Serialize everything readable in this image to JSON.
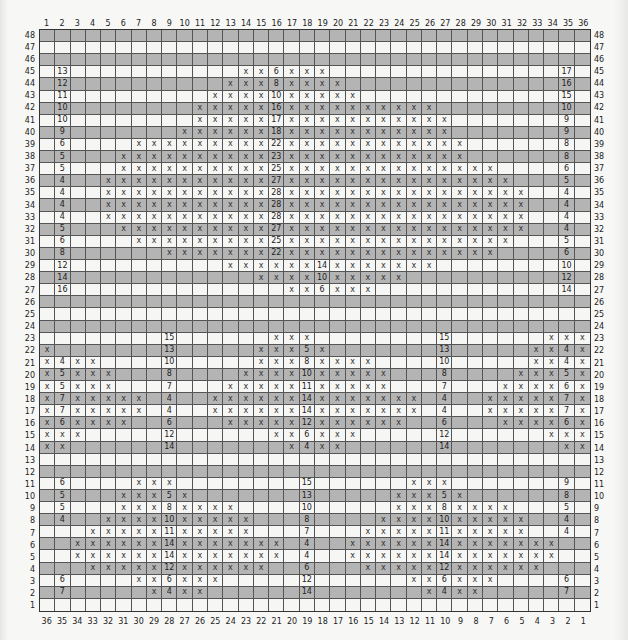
{
  "chart": {
    "columns": 36,
    "rows": 48,
    "top_column_labels": [
      "1",
      "2",
      "3",
      "4",
      "5",
      "6",
      "7",
      "8",
      "9",
      "10",
      "11",
      "12",
      "13",
      "14",
      "15",
      "16",
      "17",
      "18",
      "19",
      "20",
      "21",
      "22",
      "23",
      "24",
      "25",
      "26",
      "27",
      "28",
      "29",
      "30",
      "31",
      "32",
      "33",
      "34",
      "35",
      "36"
    ],
    "bottom_column_labels": [
      "36",
      "35",
      "34",
      "33",
      "32",
      "31",
      "30",
      "29",
      "28",
      "27",
      "26",
      "25",
      "24",
      "23",
      "22",
      "21",
      "20",
      "19",
      "18",
      "17",
      "16",
      "15",
      "14",
      "13",
      "12",
      "11",
      "10",
      "9",
      "8",
      "7",
      "6",
      "5",
      "4",
      "3",
      "2",
      "1"
    ],
    "row_labels_top_to_bottom": [
      "48",
      "47",
      "46",
      "45",
      "44",
      "43",
      "42",
      "41",
      "40",
      "39",
      "38",
      "37",
      "36",
      "35",
      "34",
      "33",
      "32",
      "31",
      "30",
      "29",
      "28",
      "27",
      "26",
      "25",
      "24",
      "23",
      "22",
      "21",
      "20",
      "19",
      "18",
      "17",
      "16",
      "15",
      "14",
      "13",
      "12",
      "11",
      "10",
      "9",
      "8",
      "7",
      "6",
      "5",
      "4",
      "3",
      "2",
      "1"
    ],
    "shading": {
      "even_rows": "#b4b4b4",
      "odd_rows": "#f6f6f4"
    },
    "stitch_symbol": "x",
    "cell_notation": "Each row lists column:value pairs; 'x' = stitch mark, numbers = stitch counts",
    "rows_data": {
      "48": {},
      "47": {},
      "46": {},
      "45": {
        "2": "13",
        "14": "x",
        "15": "x",
        "16": "6",
        "17": "x",
        "18": "x",
        "19": "x",
        "35": "17"
      },
      "44": {
        "2": "12",
        "13": "x",
        "14": "x",
        "15": "x",
        "16": "8",
        "17": "x",
        "18": "x",
        "19": "x",
        "20": "x",
        "35": "16"
      },
      "43": {
        "2": "11",
        "12": "x",
        "13": "x",
        "14": "x",
        "15": "x",
        "16": "10",
        "17": "x",
        "18": "x",
        "19": "x",
        "20": "x",
        "21": "x",
        "35": "15"
      },
      "42": {
        "2": "10",
        "11": "x",
        "12": "x",
        "13": "x",
        "14": "x",
        "15": "x",
        "16": "16",
        "17": "x",
        "18": "x",
        "19": "x",
        "20": "x",
        "21": "x",
        "22": "x",
        "23": "x",
        "24": "x",
        "25": "x",
        "26": "x",
        "35": "10"
      },
      "41": {
        "2": "10",
        "11": "x",
        "12": "x",
        "13": "x",
        "14": "x",
        "15": "x",
        "16": "17",
        "17": "x",
        "18": "x",
        "19": "x",
        "20": "x",
        "21": "x",
        "22": "x",
        "23": "x",
        "24": "x",
        "25": "x",
        "26": "x",
        "27": "x",
        "35": "9"
      },
      "40": {
        "2": "9",
        "10": "x",
        "11": "x",
        "12": "x",
        "13": "x",
        "14": "x",
        "15": "x",
        "16": "18",
        "17": "x",
        "18": "x",
        "19": "x",
        "20": "x",
        "21": "x",
        "22": "x",
        "23": "x",
        "24": "x",
        "25": "x",
        "26": "x",
        "27": "x",
        "35": "9"
      },
      "39": {
        "2": "6",
        "7": "x",
        "8": "x",
        "9": "x",
        "10": "x",
        "11": "x",
        "12": "x",
        "13": "x",
        "14": "x",
        "15": "x",
        "16": "22",
        "17": "x",
        "18": "x",
        "19": "x",
        "20": "x",
        "21": "x",
        "22": "x",
        "23": "x",
        "24": "x",
        "25": "x",
        "26": "x",
        "27": "x",
        "28": "x",
        "35": "8"
      },
      "38": {
        "2": "5",
        "6": "x",
        "7": "x",
        "8": "x",
        "9": "x",
        "10": "x",
        "11": "x",
        "12": "x",
        "13": "x",
        "14": "x",
        "15": "x",
        "16": "23",
        "17": "x",
        "18": "x",
        "19": "x",
        "20": "x",
        "21": "x",
        "22": "x",
        "23": "x",
        "24": "x",
        "25": "x",
        "26": "x",
        "27": "x",
        "28": "x",
        "35": "8"
      },
      "37": {
        "2": "5",
        "6": "x",
        "7": "x",
        "8": "x",
        "9": "x",
        "10": "x",
        "11": "x",
        "12": "x",
        "13": "x",
        "14": "x",
        "15": "x",
        "16": "25",
        "17": "x",
        "18": "x",
        "19": "x",
        "20": "x",
        "21": "x",
        "22": "x",
        "23": "x",
        "24": "x",
        "25": "x",
        "26": "x",
        "27": "x",
        "28": "x",
        "29": "x",
        "30": "x",
        "35": "6"
      },
      "36": {
        "2": "4",
        "5": "x",
        "6": "x",
        "7": "x",
        "8": "x",
        "9": "x",
        "10": "x",
        "11": "x",
        "12": "x",
        "13": "x",
        "14": "x",
        "15": "x",
        "16": "27",
        "17": "x",
        "18": "x",
        "19": "x",
        "20": "x",
        "21": "x",
        "22": "x",
        "23": "x",
        "24": "x",
        "25": "x",
        "26": "x",
        "27": "x",
        "28": "x",
        "29": "x",
        "30": "x",
        "31": "x",
        "35": "5"
      },
      "35": {
        "2": "4",
        "5": "x",
        "6": "x",
        "7": "x",
        "8": "x",
        "9": "x",
        "10": "x",
        "11": "x",
        "12": "x",
        "13": "x",
        "14": "x",
        "15": "x",
        "16": "28",
        "17": "x",
        "18": "x",
        "19": "x",
        "20": "x",
        "21": "x",
        "22": "x",
        "23": "x",
        "24": "x",
        "25": "x",
        "26": "x",
        "27": "x",
        "28": "x",
        "29": "x",
        "30": "x",
        "31": "x",
        "32": "x",
        "35": "4"
      },
      "34": {
        "2": "4",
        "5": "x",
        "6": "x",
        "7": "x",
        "8": "x",
        "9": "x",
        "10": "x",
        "11": "x",
        "12": "x",
        "13": "x",
        "14": "x",
        "15": "x",
        "16": "28",
        "17": "x",
        "18": "x",
        "19": "x",
        "20": "x",
        "21": "x",
        "22": "x",
        "23": "x",
        "24": "x",
        "25": "x",
        "26": "x",
        "27": "x",
        "28": "x",
        "29": "x",
        "30": "x",
        "31": "x",
        "32": "x",
        "35": "4"
      },
      "33": {
        "2": "4",
        "5": "x",
        "6": "x",
        "7": "x",
        "8": "x",
        "9": "x",
        "10": "x",
        "11": "x",
        "12": "x",
        "13": "x",
        "14": "x",
        "15": "x",
        "16": "28",
        "17": "x",
        "18": "x",
        "19": "x",
        "20": "x",
        "21": "x",
        "22": "x",
        "23": "x",
        "24": "x",
        "25": "x",
        "26": "x",
        "27": "x",
        "28": "x",
        "29": "x",
        "30": "x",
        "31": "x",
        "32": "x",
        "35": "4"
      },
      "32": {
        "2": "5",
        "6": "x",
        "7": "x",
        "8": "x",
        "9": "x",
        "10": "x",
        "11": "x",
        "12": "x",
        "13": "x",
        "14": "x",
        "15": "x",
        "16": "27",
        "17": "x",
        "18": "x",
        "19": "x",
        "20": "x",
        "21": "x",
        "22": "x",
        "23": "x",
        "24": "x",
        "25": "x",
        "26": "x",
        "27": "x",
        "28": "x",
        "29": "x",
        "30": "x",
        "31": "x",
        "32": "x",
        "35": "4"
      },
      "31": {
        "2": "6",
        "7": "x",
        "8": "x",
        "9": "x",
        "10": "x",
        "11": "x",
        "12": "x",
        "13": "x",
        "14": "x",
        "15": "x",
        "16": "25",
        "17": "x",
        "18": "x",
        "19": "x",
        "20": "x",
        "21": "x",
        "22": "x",
        "23": "x",
        "24": "x",
        "25": "x",
        "26": "x",
        "27": "x",
        "28": "x",
        "29": "x",
        "30": "x",
        "31": "x",
        "35": "5"
      },
      "30": {
        "2": "8",
        "9": "x",
        "10": "x",
        "11": "x",
        "12": "x",
        "13": "x",
        "14": "x",
        "15": "x",
        "16": "22",
        "17": "x",
        "18": "x",
        "19": "x",
        "20": "x",
        "21": "x",
        "22": "x",
        "23": "x",
        "24": "x",
        "25": "x",
        "26": "x",
        "27": "x",
        "28": "x",
        "29": "x",
        "30": "x",
        "35": "6"
      },
      "29": {
        "2": "12",
        "13": "x",
        "14": "x",
        "15": "x",
        "16": "x",
        "17": "x",
        "18": "x",
        "19": "14",
        "20": "x",
        "21": "x",
        "22": "x",
        "23": "x",
        "24": "x",
        "25": "x",
        "26": "x",
        "35": "10"
      },
      "28": {
        "2": "14",
        "15": "x",
        "16": "x",
        "17": "x",
        "18": "x",
        "19": "10",
        "20": "x",
        "21": "x",
        "22": "x",
        "23": "x",
        "24": "x",
        "35": "12"
      },
      "27": {
        "2": "16",
        "17": "x",
        "18": "x",
        "19": "6",
        "20": "x",
        "21": "x",
        "22": "x",
        "35": "14"
      },
      "26": {},
      "25": {},
      "24": {},
      "23": {
        "9": "15",
        "16": "x",
        "17": "x",
        "18": "x",
        "27": "15",
        "34": "x",
        "35": "x",
        "36": "x"
      },
      "22": {
        "1": "x",
        "9": "13",
        "15": "x",
        "16": "x",
        "17": "x",
        "18": "5",
        "19": "x",
        "27": "13",
        "33": "x",
        "34": "x",
        "35": "4",
        "36": "x"
      },
      "21": {
        "1": "x",
        "2": "4",
        "3": "x",
        "4": "x",
        "9": "10",
        "15": "x",
        "16": "x",
        "17": "x",
        "18": "8",
        "19": "x",
        "20": "x",
        "21": "x",
        "22": "x",
        "27": "10",
        "33": "x",
        "34": "x",
        "35": "4",
        "36": "x"
      },
      "20": {
        "1": "x",
        "2": "5",
        "3": "x",
        "4": "x",
        "5": "x",
        "9": "8",
        "14": "x",
        "15": "x",
        "16": "x",
        "17": "x",
        "18": "10",
        "19": "x",
        "20": "x",
        "21": "x",
        "22": "x",
        "23": "x",
        "27": "8",
        "32": "x",
        "33": "x",
        "34": "x",
        "35": "5",
        "36": "x"
      },
      "19": {
        "1": "x",
        "2": "5",
        "3": "x",
        "4": "x",
        "5": "x",
        "9": "7",
        "13": "x",
        "14": "x",
        "15": "x",
        "16": "x",
        "17": "x",
        "18": "11",
        "19": "x",
        "20": "x",
        "21": "x",
        "22": "x",
        "23": "x",
        "27": "7",
        "31": "x",
        "32": "x",
        "33": "x",
        "34": "x",
        "35": "6",
        "36": "x"
      },
      "18": {
        "1": "x",
        "2": "7",
        "3": "x",
        "4": "x",
        "5": "x",
        "6": "x",
        "7": "x",
        "9": "4",
        "12": "x",
        "13": "x",
        "14": "x",
        "15": "x",
        "16": "x",
        "17": "x",
        "18": "14",
        "19": "x",
        "20": "x",
        "21": "x",
        "22": "x",
        "23": "x",
        "24": "x",
        "25": "x",
        "27": "4",
        "30": "x",
        "31": "x",
        "32": "x",
        "33": "x",
        "34": "x",
        "35": "7",
        "36": "x"
      },
      "17": {
        "1": "x",
        "2": "7",
        "3": "x",
        "4": "x",
        "5": "x",
        "6": "x",
        "7": "x",
        "9": "4",
        "12": "x",
        "13": "x",
        "14": "x",
        "15": "x",
        "16": "x",
        "17": "x",
        "18": "14",
        "19": "x",
        "20": "x",
        "21": "x",
        "22": "x",
        "23": "x",
        "24": "x",
        "25": "x",
        "27": "4",
        "30": "x",
        "31": "x",
        "32": "x",
        "33": "x",
        "34": "x",
        "35": "7",
        "36": "x"
      },
      "16": {
        "1": "x",
        "2": "6",
        "3": "x",
        "4": "x",
        "5": "x",
        "6": "x",
        "9": "6",
        "13": "x",
        "14": "x",
        "15": "x",
        "16": "x",
        "17": "x",
        "18": "12",
        "19": "x",
        "20": "x",
        "21": "x",
        "22": "x",
        "23": "x",
        "24": "x",
        "27": "6",
        "31": "x",
        "32": "x",
        "33": "x",
        "34": "x",
        "35": "6",
        "36": "x"
      },
      "15": {
        "1": "x",
        "2": "x",
        "3": "x",
        "9": "12",
        "16": "x",
        "17": "x",
        "18": "6",
        "19": "x",
        "20": "x",
        "21": "x",
        "27": "12",
        "34": "x",
        "35": "x",
        "36": "x"
      },
      "14": {
        "1": "x",
        "2": "x",
        "9": "14",
        "17": "x",
        "18": "4",
        "19": "x",
        "20": "x",
        "27": "14",
        "35": "x",
        "36": "x"
      },
      "13": {},
      "12": {},
      "11": {
        "2": "6",
        "7": "x",
        "8": "x",
        "9": "x",
        "18": "15",
        "25": "x",
        "26": "x",
        "27": "x",
        "35": "9"
      },
      "10": {
        "2": "5",
        "6": "x",
        "7": "x",
        "8": "x",
        "9": "5",
        "10": "x",
        "18": "13",
        "24": "x",
        "25": "x",
        "26": "x",
        "27": "5",
        "28": "x",
        "35": "8"
      },
      "9": {
        "2": "5",
        "6": "x",
        "7": "x",
        "8": "x",
        "9": "8",
        "10": "x",
        "11": "x",
        "12": "x",
        "13": "x",
        "18": "10",
        "24": "x",
        "25": "x",
        "26": "x",
        "27": "8",
        "28": "x",
        "29": "x",
        "30": "x",
        "31": "x",
        "35": "5"
      },
      "8": {
        "2": "4",
        "5": "x",
        "6": "x",
        "7": "x",
        "8": "x",
        "9": "10",
        "10": "x",
        "11": "x",
        "12": "x",
        "13": "x",
        "14": "x",
        "18": "8",
        "23": "x",
        "24": "x",
        "25": "x",
        "26": "x",
        "27": "10",
        "28": "x",
        "29": "x",
        "30": "x",
        "31": "x",
        "32": "x",
        "35": "4"
      },
      "7": {
        "4": "x",
        "5": "x",
        "6": "x",
        "7": "x",
        "8": "x",
        "9": "11",
        "10": "x",
        "11": "x",
        "12": "x",
        "13": "x",
        "14": "x",
        "18": "7",
        "22": "x",
        "23": "x",
        "24": "x",
        "25": "x",
        "26": "x",
        "27": "11",
        "28": "x",
        "29": "x",
        "30": "x",
        "31": "x",
        "32": "x",
        "35": "4"
      },
      "6": {
        "3": "x",
        "4": "x",
        "5": "x",
        "6": "x",
        "7": "x",
        "8": "x",
        "9": "14",
        "10": "x",
        "11": "x",
        "12": "x",
        "13": "x",
        "14": "x",
        "15": "x",
        "16": "x",
        "18": "4",
        "21": "x",
        "22": "x",
        "23": "x",
        "24": "x",
        "25": "x",
        "26": "x",
        "27": "14",
        "28": "x",
        "29": "x",
        "30": "x",
        "31": "x",
        "32": "x",
        "33": "x",
        "34": "x"
      },
      "5": {
        "3": "x",
        "4": "x",
        "5": "x",
        "6": "x",
        "7": "x",
        "8": "x",
        "9": "14",
        "10": "x",
        "11": "x",
        "12": "x",
        "13": "x",
        "14": "x",
        "15": "x",
        "16": "x",
        "18": "4",
        "21": "x",
        "22": "x",
        "23": "x",
        "24": "x",
        "25": "x",
        "26": "x",
        "27": "14",
        "28": "x",
        "29": "x",
        "30": "x",
        "31": "x",
        "32": "x",
        "33": "x",
        "34": "x"
      },
      "4": {
        "4": "x",
        "5": "x",
        "6": "x",
        "7": "x",
        "8": "x",
        "9": "12",
        "10": "x",
        "11": "x",
        "12": "x",
        "13": "x",
        "14": "x",
        "15": "x",
        "18": "6",
        "22": "x",
        "23": "x",
        "24": "x",
        "25": "x",
        "26": "x",
        "27": "12",
        "28": "x",
        "29": "x",
        "30": "x",
        "31": "x",
        "32": "x",
        "33": "x"
      },
      "3": {
        "2": "6",
        "7": "x",
        "8": "x",
        "9": "6",
        "10": "x",
        "11": "x",
        "12": "x",
        "18": "12",
        "25": "x",
        "26": "x",
        "27": "6",
        "28": "x",
        "29": "x",
        "30": "x",
        "35": "6"
      },
      "2": {
        "2": "7",
        "8": "x",
        "9": "4",
        "10": "x",
        "11": "x",
        "18": "14",
        "26": "x",
        "27": "4",
        "28": "x",
        "29": "x",
        "35": "7"
      },
      "1": {}
    }
  }
}
